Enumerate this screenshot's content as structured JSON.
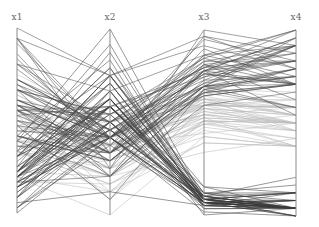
{
  "chart_data": {
    "type": "parallel_coordinates",
    "title": "",
    "axes": [
      "x1",
      "x2",
      "x3",
      "x4"
    ],
    "axis_positions_px": [
      17,
      110,
      204,
      296
    ],
    "axis_top_px": [
      28,
      29,
      30,
      30
    ],
    "axis_bottom_px": [
      213,
      215,
      215,
      216
    ],
    "grid": false,
    "legend": "none",
    "classes": [
      {
        "name": "class-0",
        "color": "#3a3a3a",
        "opacity": 0.75
      },
      {
        "name": "class-1",
        "color": "#bdbdbd",
        "opacity": 0.8
      },
      {
        "name": "class-2",
        "color": "#4a4a4a",
        "opacity": 0.75
      }
    ],
    "ranges": [
      [
        4.3,
        7.9
      ],
      [
        2.0,
        4.4
      ],
      [
        1.0,
        6.9
      ],
      [
        0.1,
        2.5
      ]
    ],
    "rows": [
      [
        5.1,
        3.5,
        1.4,
        0.2,
        0
      ],
      [
        4.9,
        3.0,
        1.4,
        0.2,
        0
      ],
      [
        4.7,
        3.2,
        1.3,
        0.2,
        0
      ],
      [
        4.6,
        3.1,
        1.5,
        0.2,
        0
      ],
      [
        5.0,
        3.6,
        1.4,
        0.2,
        0
      ],
      [
        5.4,
        3.9,
        1.7,
        0.4,
        0
      ],
      [
        4.6,
        3.4,
        1.4,
        0.3,
        0
      ],
      [
        5.0,
        3.4,
        1.5,
        0.2,
        0
      ],
      [
        4.4,
        2.9,
        1.4,
        0.2,
        0
      ],
      [
        4.9,
        3.1,
        1.5,
        0.1,
        0
      ],
      [
        5.4,
        3.7,
        1.5,
        0.2,
        0
      ],
      [
        4.8,
        3.4,
        1.6,
        0.2,
        0
      ],
      [
        4.8,
        3.0,
        1.4,
        0.1,
        0
      ],
      [
        4.3,
        3.0,
        1.1,
        0.1,
        0
      ],
      [
        5.8,
        4.0,
        1.2,
        0.2,
        0
      ],
      [
        5.7,
        4.4,
        1.5,
        0.4,
        0
      ],
      [
        5.4,
        3.9,
        1.3,
        0.4,
        0
      ],
      [
        5.1,
        3.5,
        1.4,
        0.3,
        0
      ],
      [
        5.7,
        3.8,
        1.7,
        0.3,
        0
      ],
      [
        5.1,
        3.8,
        1.5,
        0.3,
        0
      ],
      [
        5.4,
        3.4,
        1.7,
        0.2,
        0
      ],
      [
        5.1,
        3.7,
        1.5,
        0.4,
        0
      ],
      [
        4.6,
        3.6,
        1.0,
        0.2,
        0
      ],
      [
        5.1,
        3.3,
        1.7,
        0.5,
        0
      ],
      [
        4.8,
        3.4,
        1.9,
        0.2,
        0
      ],
      [
        5.0,
        3.0,
        1.6,
        0.2,
        0
      ],
      [
        5.0,
        3.4,
        1.6,
        0.4,
        0
      ],
      [
        5.2,
        3.5,
        1.5,
        0.2,
        0
      ],
      [
        5.2,
        3.4,
        1.4,
        0.2,
        0
      ],
      [
        4.7,
        3.2,
        1.6,
        0.2,
        0
      ],
      [
        4.8,
        3.1,
        1.6,
        0.2,
        0
      ],
      [
        5.4,
        3.4,
        1.5,
        0.4,
        0
      ],
      [
        5.2,
        4.1,
        1.5,
        0.1,
        0
      ],
      [
        5.5,
        4.2,
        1.4,
        0.2,
        0
      ],
      [
        4.9,
        3.1,
        1.5,
        0.2,
        0
      ],
      [
        5.0,
        3.2,
        1.2,
        0.2,
        0
      ],
      [
        5.5,
        3.5,
        1.3,
        0.2,
        0
      ],
      [
        4.9,
        3.6,
        1.4,
        0.1,
        0
      ],
      [
        4.4,
        3.0,
        1.3,
        0.2,
        0
      ],
      [
        5.1,
        3.4,
        1.5,
        0.2,
        0
      ],
      [
        5.0,
        3.5,
        1.3,
        0.3,
        0
      ],
      [
        4.5,
        2.3,
        1.3,
        0.3,
        0
      ],
      [
        4.4,
        3.2,
        1.3,
        0.2,
        0
      ],
      [
        5.0,
        3.5,
        1.6,
        0.6,
        0
      ],
      [
        5.1,
        3.8,
        1.9,
        0.4,
        0
      ],
      [
        4.8,
        3.0,
        1.4,
        0.3,
        0
      ],
      [
        5.1,
        3.8,
        1.6,
        0.2,
        0
      ],
      [
        4.6,
        3.2,
        1.4,
        0.2,
        0
      ],
      [
        5.3,
        3.7,
        1.5,
        0.2,
        0
      ],
      [
        5.0,
        3.3,
        1.4,
        0.2,
        0
      ],
      [
        7.0,
        3.2,
        4.7,
        1.4,
        1
      ],
      [
        6.4,
        3.2,
        4.5,
        1.5,
        1
      ],
      [
        6.9,
        3.1,
        4.9,
        1.5,
        1
      ],
      [
        5.5,
        2.3,
        4.0,
        1.3,
        1
      ],
      [
        6.5,
        2.8,
        4.6,
        1.5,
        1
      ],
      [
        5.7,
        2.8,
        4.5,
        1.3,
        1
      ],
      [
        6.3,
        3.3,
        4.7,
        1.6,
        1
      ],
      [
        4.9,
        2.4,
        3.3,
        1.0,
        1
      ],
      [
        6.6,
        2.9,
        4.6,
        1.3,
        1
      ],
      [
        5.2,
        2.7,
        3.9,
        1.4,
        1
      ],
      [
        5.0,
        2.0,
        3.5,
        1.0,
        1
      ],
      [
        5.9,
        3.0,
        4.2,
        1.5,
        1
      ],
      [
        6.0,
        2.2,
        4.0,
        1.0,
        1
      ],
      [
        6.1,
        2.9,
        4.7,
        1.4,
        1
      ],
      [
        5.6,
        2.9,
        3.6,
        1.3,
        1
      ],
      [
        6.7,
        3.1,
        4.4,
        1.4,
        1
      ],
      [
        5.6,
        3.0,
        4.5,
        1.5,
        1
      ],
      [
        5.8,
        2.7,
        4.1,
        1.0,
        1
      ],
      [
        6.2,
        2.2,
        4.5,
        1.5,
        1
      ],
      [
        5.6,
        2.5,
        3.9,
        1.1,
        1
      ],
      [
        5.9,
        3.2,
        4.8,
        1.8,
        1
      ],
      [
        6.1,
        2.8,
        4.0,
        1.3,
        1
      ],
      [
        6.3,
        2.5,
        4.9,
        1.5,
        1
      ],
      [
        6.1,
        2.8,
        4.7,
        1.2,
        1
      ],
      [
        6.4,
        2.9,
        4.3,
        1.3,
        1
      ],
      [
        6.6,
        3.0,
        4.4,
        1.4,
        1
      ],
      [
        6.8,
        2.8,
        4.8,
        1.4,
        1
      ],
      [
        6.7,
        3.0,
        5.0,
        1.7,
        1
      ],
      [
        6.0,
        2.9,
        4.5,
        1.5,
        1
      ],
      [
        5.7,
        2.6,
        3.5,
        1.0,
        1
      ],
      [
        5.5,
        2.4,
        3.8,
        1.1,
        1
      ],
      [
        5.5,
        2.4,
        3.7,
        1.0,
        1
      ],
      [
        5.8,
        2.7,
        3.9,
        1.2,
        1
      ],
      [
        6.0,
        2.7,
        5.1,
        1.6,
        1
      ],
      [
        5.4,
        3.0,
        4.5,
        1.5,
        1
      ],
      [
        6.0,
        3.4,
        4.5,
        1.6,
        1
      ],
      [
        6.7,
        3.1,
        4.7,
        1.5,
        1
      ],
      [
        6.3,
        2.3,
        4.4,
        1.3,
        1
      ],
      [
        5.6,
        3.0,
        4.1,
        1.3,
        1
      ],
      [
        5.5,
        2.5,
        4.0,
        1.3,
        1
      ],
      [
        5.5,
        2.6,
        4.4,
        1.2,
        1
      ],
      [
        6.1,
        3.0,
        4.6,
        1.4,
        1
      ],
      [
        5.8,
        2.6,
        4.0,
        1.2,
        1
      ],
      [
        5.0,
        2.3,
        3.3,
        1.0,
        1
      ],
      [
        5.6,
        2.7,
        4.2,
        1.3,
        1
      ],
      [
        5.7,
        3.0,
        4.2,
        1.2,
        1
      ],
      [
        5.7,
        2.9,
        4.2,
        1.3,
        1
      ],
      [
        6.2,
        2.9,
        4.3,
        1.3,
        1
      ],
      [
        5.1,
        2.5,
        3.0,
        1.1,
        1
      ],
      [
        5.7,
        2.8,
        4.1,
        1.3,
        1
      ],
      [
        6.3,
        3.3,
        6.0,
        2.5,
        2
      ],
      [
        5.8,
        2.7,
        5.1,
        1.9,
        2
      ],
      [
        7.1,
        3.0,
        5.9,
        2.1,
        2
      ],
      [
        6.3,
        2.9,
        5.6,
        1.8,
        2
      ],
      [
        6.5,
        3.0,
        5.8,
        2.2,
        2
      ],
      [
        7.6,
        3.0,
        6.6,
        2.1,
        2
      ],
      [
        4.9,
        2.5,
        4.5,
        1.7,
        2
      ],
      [
        7.3,
        2.9,
        6.3,
        1.8,
        2
      ],
      [
        6.7,
        2.5,
        5.8,
        1.8,
        2
      ],
      [
        7.2,
        3.6,
        6.1,
        2.5,
        2
      ],
      [
        6.5,
        3.2,
        5.1,
        2.0,
        2
      ],
      [
        6.4,
        2.7,
        5.3,
        1.9,
        2
      ],
      [
        6.8,
        3.0,
        5.5,
        2.1,
        2
      ],
      [
        5.7,
        2.5,
        5.0,
        2.0,
        2
      ],
      [
        5.8,
        2.8,
        5.1,
        2.4,
        2
      ],
      [
        6.4,
        3.2,
        5.3,
        2.3,
        2
      ],
      [
        6.5,
        3.0,
        5.5,
        1.8,
        2
      ],
      [
        7.7,
        3.8,
        6.7,
        2.2,
        2
      ],
      [
        7.7,
        2.6,
        6.9,
        2.3,
        2
      ],
      [
        6.0,
        2.2,
        5.0,
        1.5,
        2
      ],
      [
        6.9,
        3.2,
        5.7,
        2.3,
        2
      ],
      [
        5.6,
        2.8,
        4.9,
        2.0,
        2
      ],
      [
        7.7,
        2.8,
        6.7,
        2.0,
        2
      ],
      [
        6.3,
        2.7,
        4.9,
        1.8,
        2
      ],
      [
        6.7,
        3.3,
        5.7,
        2.1,
        2
      ],
      [
        7.2,
        3.2,
        6.0,
        1.8,
        2
      ],
      [
        6.2,
        2.8,
        4.8,
        1.8,
        2
      ],
      [
        6.1,
        3.0,
        4.9,
        1.8,
        2
      ],
      [
        6.4,
        2.8,
        5.6,
        2.1,
        2
      ],
      [
        7.2,
        3.0,
        5.8,
        1.6,
        2
      ],
      [
        7.4,
        2.8,
        6.1,
        1.9,
        2
      ],
      [
        7.9,
        3.8,
        6.4,
        2.0,
        2
      ],
      [
        6.4,
        2.8,
        5.6,
        2.2,
        2
      ],
      [
        6.3,
        2.8,
        5.1,
        1.5,
        2
      ],
      [
        6.1,
        2.6,
        5.6,
        1.4,
        2
      ],
      [
        7.7,
        3.0,
        6.1,
        2.3,
        2
      ],
      [
        6.3,
        3.4,
        5.6,
        2.4,
        2
      ],
      [
        6.4,
        3.1,
        5.5,
        1.8,
        2
      ],
      [
        6.0,
        3.0,
        4.8,
        1.8,
        2
      ],
      [
        6.9,
        3.1,
        5.4,
        2.1,
        2
      ],
      [
        6.7,
        3.1,
        5.6,
        2.4,
        2
      ],
      [
        6.9,
        3.1,
        5.1,
        2.3,
        2
      ],
      [
        5.8,
        2.7,
        5.1,
        1.9,
        2
      ],
      [
        6.8,
        3.2,
        5.9,
        2.3,
        2
      ],
      [
        6.7,
        3.3,
        5.7,
        2.5,
        2
      ],
      [
        6.7,
        3.0,
        5.2,
        2.3,
        2
      ],
      [
        6.3,
        2.5,
        5.0,
        1.9,
        2
      ],
      [
        6.5,
        3.0,
        5.2,
        2.0,
        2
      ],
      [
        6.2,
        3.4,
        5.4,
        2.3,
        2
      ],
      [
        5.9,
        3.0,
        5.1,
        1.8,
        2
      ]
    ],
    "axis_color": "#8a8a8a"
  }
}
